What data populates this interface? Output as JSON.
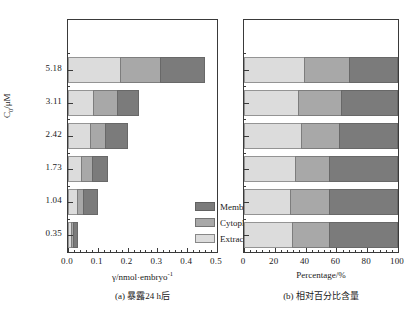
{
  "chart_data": [
    {
      "type": "bar",
      "id": "panel-a",
      "orientation": "horizontal",
      "stacked": true,
      "title": "",
      "caption": "(a) 暴露24 h后",
      "xlabel": "γ/nmol·embryo",
      "xlabel_sup": "-1",
      "ylabel": "C",
      "ylabel_sub": "0",
      "ylabel_unit": "/μM",
      "categories": [
        "0.35",
        "1.04",
        "1.73",
        "2.42",
        "3.11",
        "5.18"
      ],
      "xlim": [
        0.0,
        0.5
      ],
      "xticks": [
        0.0,
        0.1,
        0.2,
        0.3,
        0.4,
        0.5
      ],
      "xticklabels": [
        "0.0",
        "0.1",
        "0.2",
        "0.3",
        "0.4",
        "0.5"
      ],
      "minor_xticks_per_interval": 4,
      "grid": false,
      "legend": [
        "Membrane",
        "Cytoplasm",
        "Extracellular"
      ],
      "legend_position": "inside-right",
      "series": [
        {
          "name": "Extracellular",
          "color": "#dcdcdc",
          "values": [
            0.01,
            0.03,
            0.043,
            0.073,
            0.083,
            0.173
          ]
        },
        {
          "name": "Cytoplasm",
          "color": "#a8a8a8",
          "values": [
            0.008,
            0.02,
            0.037,
            0.05,
            0.08,
            0.137
          ]
        },
        {
          "name": "Membrane",
          "color": "#7b7b7b",
          "values": [
            0.015,
            0.05,
            0.053,
            0.077,
            0.077,
            0.15
          ]
        }
      ],
      "totals": [
        0.033,
        0.1,
        0.133,
        0.2,
        0.24,
        0.46
      ]
    },
    {
      "type": "bar",
      "id": "panel-b",
      "orientation": "horizontal",
      "stacked": true,
      "title": "",
      "caption": "(b) 相对百分比含量",
      "xlabel": "Percentage/%",
      "ylabel": "",
      "categories": [
        "0.35",
        "1.04",
        "1.73",
        "2.42",
        "3.11",
        "5.18"
      ],
      "xlim": [
        0,
        100
      ],
      "xticks": [
        0,
        20,
        40,
        60,
        80,
        100
      ],
      "xticklabels": [
        "0",
        "20",
        "40",
        "60",
        "80",
        "100"
      ],
      "minor_xticks_per_interval": 4,
      "grid": false,
      "legend": [
        "Membrane",
        "Cytoplasm",
        "Extracellular"
      ],
      "series": [
        {
          "name": "Extracellular",
          "color": "#dcdcdc",
          "values": [
            31,
            30,
            33,
            37,
            35,
            39
          ]
        },
        {
          "name": "Cytoplasm",
          "color": "#a8a8a8",
          "values": [
            24,
            25,
            22,
            25,
            28,
            29
          ]
        },
        {
          "name": "Membrane",
          "color": "#7b7b7b",
          "values": [
            45,
            45,
            45,
            38,
            37,
            32
          ]
        }
      ],
      "totals": [
        100,
        100,
        100,
        100,
        100,
        100
      ]
    }
  ],
  "colors": {
    "membrane": "#7b7b7b",
    "cytoplasm": "#a8a8a8",
    "extracellular": "#dcdcdc",
    "axis": "#3a3a3a",
    "text": "#1a1a1a",
    "background": "#ffffff"
  }
}
